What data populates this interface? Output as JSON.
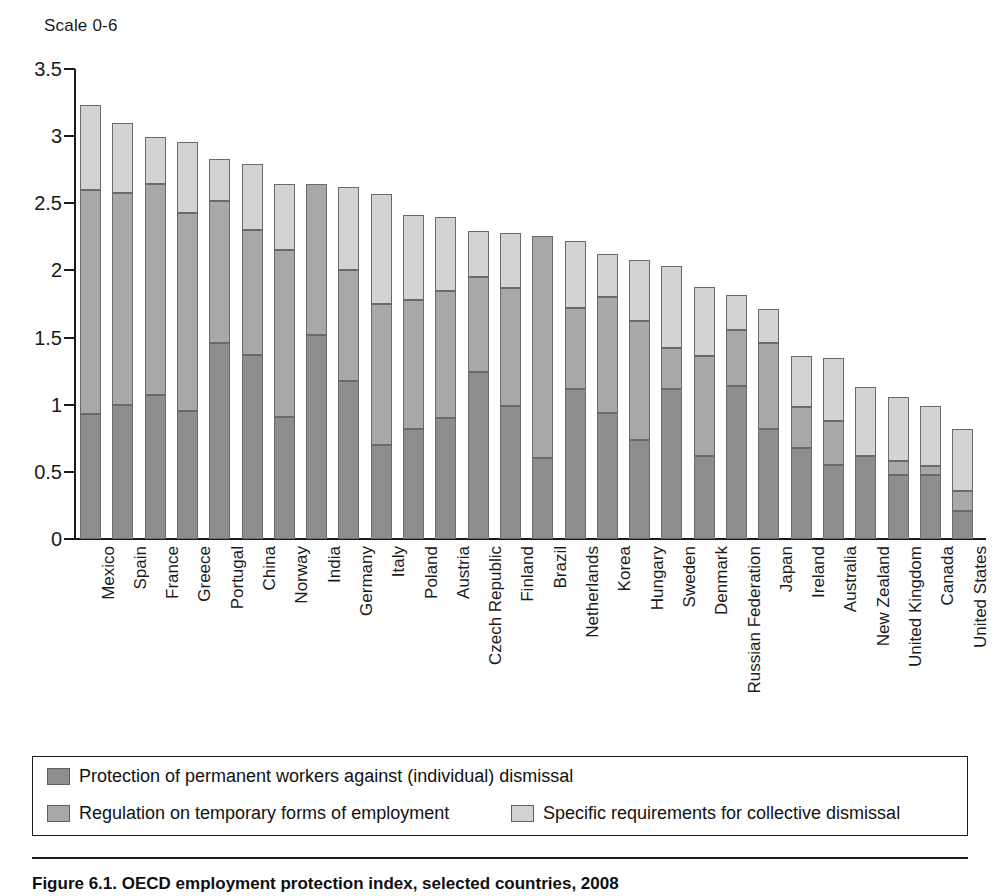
{
  "scale_note": "Scale 0-6",
  "figure_caption": "Figure 6.1.  OECD employment protection index, selected countries, 2008",
  "legend": {
    "items": [
      {
        "label": "Protection of permanent workers against (individual) dismissal",
        "color": "#8e8e8e",
        "key": "permanent"
      },
      {
        "label": "Regulation on temporary forms of employment",
        "color": "#a8a8a8",
        "key": "temporary"
      },
      {
        "label": "Specific requirements for collective dismissal",
        "color": "#d3d3d3",
        "key": "collective"
      }
    ]
  },
  "chart_data": {
    "type": "bar",
    "subtype": "stacked-vertical",
    "title": "Figure 6.1.  OECD employment protection index, selected countries, 2008",
    "subtitle": "Scale 0-6",
    "xlabel": "",
    "ylabel": "Scale 0-6",
    "ylim": [
      0,
      3.5
    ],
    "yticks": [
      "0",
      "0.5",
      "1",
      "1.5",
      "2",
      "2.5",
      "3",
      "3.5"
    ],
    "ytick_values": [
      0,
      0.5,
      1,
      1.5,
      2,
      2.5,
      3,
      3.5
    ],
    "grid": false,
    "legend_position": "bottom",
    "categories": [
      "Mexico",
      "Spain",
      "France",
      "Greece",
      "Portugal",
      "China",
      "Norway",
      "India",
      "Germany",
      "Italy",
      "Poland",
      "Austria",
      "Czech Republic",
      "Finland",
      "Brazil",
      "Netherlands",
      "Korea",
      "Hungary",
      "Sweden",
      "Denmark",
      "Russian Federation",
      "Japan",
      "Ireland",
      "Australia",
      "New Zealand",
      "United Kingdom",
      "Canada",
      "United States"
    ],
    "series": [
      {
        "name": "Protection of permanent workers against (individual) dismissal",
        "color": "#8e8e8e",
        "values": [
          0.93,
          1.0,
          1.07,
          0.95,
          1.46,
          1.37,
          0.91,
          1.52,
          1.18,
          0.7,
          0.82,
          0.9,
          1.24,
          0.99,
          0.6,
          1.12,
          0.94,
          0.74,
          1.12,
          0.62,
          1.14,
          0.82,
          0.68,
          0.55,
          0.62,
          0.48,
          0.48,
          0.21
        ]
      },
      {
        "name": "Regulation on temporary forms of employment",
        "color": "#a8a8a8",
        "values": [
          1.67,
          1.58,
          1.57,
          1.48,
          1.06,
          0.93,
          1.24,
          1.12,
          0.82,
          1.05,
          0.96,
          0.95,
          0.71,
          0.88,
          1.66,
          0.6,
          0.86,
          0.88,
          0.3,
          0.74,
          0.42,
          0.64,
          0.3,
          0.33,
          0.0,
          0.1,
          0.06,
          0.15
        ]
      },
      {
        "name": "Specific requirements for collective dismissal",
        "color": "#d3d3d3",
        "values": [
          0.63,
          0.52,
          0.35,
          0.53,
          0.31,
          0.49,
          0.49,
          0.0,
          0.62,
          0.82,
          0.63,
          0.55,
          0.34,
          0.41,
          0.0,
          0.5,
          0.32,
          0.46,
          0.61,
          0.52,
          0.26,
          0.25,
          0.38,
          0.47,
          0.51,
          0.48,
          0.45,
          0.46
        ]
      }
    ],
    "totals": [
      3.23,
      3.1,
      2.99,
      2.96,
      2.83,
      2.79,
      2.64,
      2.64,
      2.62,
      2.57,
      2.41,
      2.4,
      2.29,
      2.28,
      2.26,
      2.22,
      2.12,
      2.08,
      2.03,
      1.88,
      1.82,
      1.71,
      1.36,
      1.35,
      1.13,
      1.06,
      0.99,
      0.82
    ]
  }
}
